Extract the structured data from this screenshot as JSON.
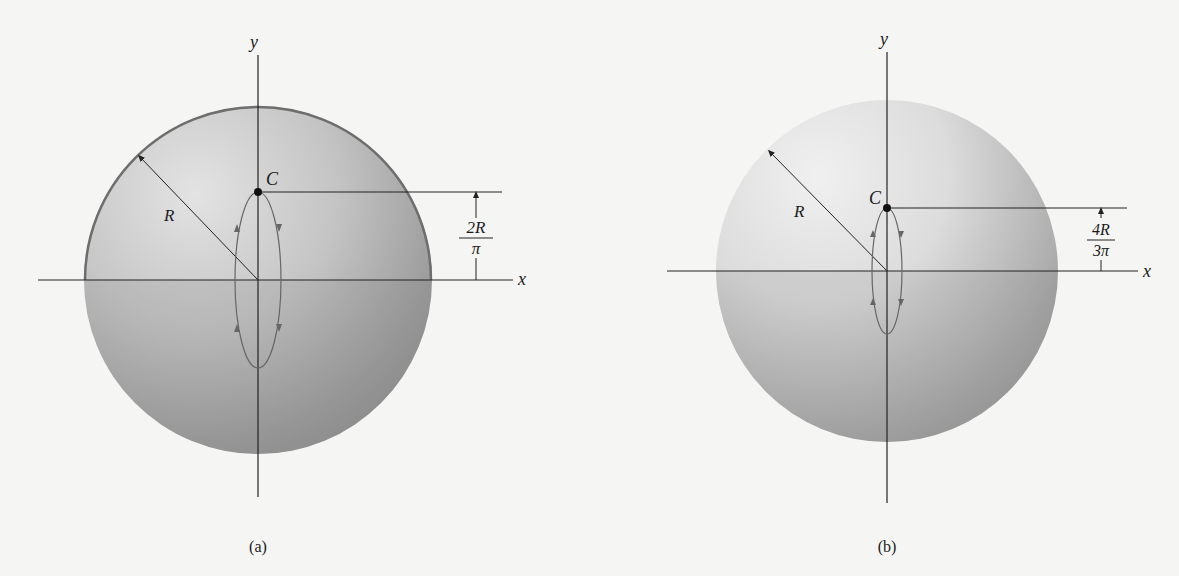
{
  "figures": [
    {
      "id": "a",
      "caption": "(a)",
      "axis_x_label": "x",
      "axis_y_label": "y",
      "radius_label": "R",
      "centroid_label": "C",
      "dimension": {
        "numerator": "2R",
        "denominator": "π"
      },
      "shape": "hemispherical shell (thin surface)",
      "center": [
        258,
        280
      ],
      "radius_px": 174,
      "centroid_y": 192,
      "ellipse": {
        "rx": 22,
        "top": 192,
        "bottom": 368
      }
    },
    {
      "id": "b",
      "caption": "(b)",
      "axis_x_label": "x",
      "axis_y_label": "y",
      "radius_label": "R",
      "centroid_label": "C",
      "dimension": {
        "numerator": "4R",
        "denominator": "3π"
      },
      "shape": "solid hemisphere",
      "center": [
        887,
        271
      ],
      "radius_px": 171,
      "centroid_y": 208,
      "ellipse": {
        "rx": 15,
        "top": 208,
        "bottom": 335
      }
    }
  ],
  "colors": {
    "background": "#f5f5f4",
    "sphere_light": "#d8d8d8",
    "sphere_dark": "#8a8a8a",
    "outline_a": "#6e6e6e",
    "axis": "#222222",
    "ellipse": "#6a6a6a"
  }
}
